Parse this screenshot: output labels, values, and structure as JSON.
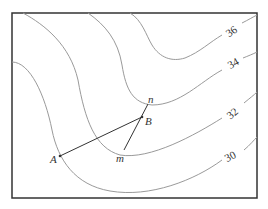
{
  "diagram": {
    "type": "contour-map",
    "contours": [
      {
        "value": "30",
        "label": "30"
      },
      {
        "value": "32",
        "label": "32"
      },
      {
        "value": "34",
        "label": "34"
      },
      {
        "value": "36",
        "label": "36"
      }
    ],
    "points": {
      "A": "A",
      "B": "B",
      "m": "m",
      "n": "n"
    },
    "segments": [
      "A-B",
      "m-n"
    ]
  }
}
